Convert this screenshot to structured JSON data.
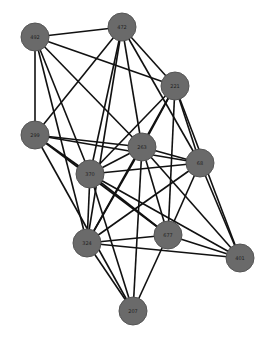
{
  "graph": {
    "colors": {
      "background": "#ffffff",
      "node_fill": "#6a6a6a",
      "edge": "#111111",
      "label": "#222222"
    },
    "nodes": [
      {
        "id": "492",
        "label": "492",
        "x": 35,
        "y": 37
      },
      {
        "id": "472",
        "label": "472",
        "x": 122,
        "y": 27
      },
      {
        "id": "221",
        "label": "221",
        "x": 175,
        "y": 86
      },
      {
        "id": "299",
        "label": "299",
        "x": 35,
        "y": 135
      },
      {
        "id": "263",
        "label": "263",
        "x": 142,
        "y": 147
      },
      {
        "id": "68",
        "label": "68",
        "x": 200,
        "y": 163
      },
      {
        "id": "370",
        "label": "370",
        "x": 90,
        "y": 174
      },
      {
        "id": "324",
        "label": "324",
        "x": 87,
        "y": 243
      },
      {
        "id": "677",
        "label": "677",
        "x": 168,
        "y": 235
      },
      {
        "id": "401",
        "label": "401",
        "x": 240,
        "y": 258
      },
      {
        "id": "207",
        "label": "207",
        "x": 133,
        "y": 311
      }
    ],
    "edges": [
      [
        "492",
        "472"
      ],
      [
        "492",
        "221"
      ],
      [
        "492",
        "299"
      ],
      [
        "492",
        "370"
      ],
      [
        "492",
        "263"
      ],
      [
        "492",
        "324"
      ],
      [
        "472",
        "221"
      ],
      [
        "472",
        "299"
      ],
      [
        "472",
        "263"
      ],
      [
        "472",
        "68"
      ],
      [
        "472",
        "370"
      ],
      [
        "472",
        "324"
      ],
      [
        "221",
        "263"
      ],
      [
        "221",
        "370"
      ],
      [
        "221",
        "68"
      ],
      [
        "221",
        "677"
      ],
      [
        "221",
        "401"
      ],
      [
        "221",
        "324"
      ],
      [
        "299",
        "263"
      ],
      [
        "299",
        "68"
      ],
      [
        "299",
        "370"
      ],
      [
        "299",
        "677"
      ],
      [
        "299",
        "207"
      ],
      [
        "263",
        "370"
      ],
      [
        "263",
        "68"
      ],
      [
        "263",
        "324"
      ],
      [
        "263",
        "677"
      ],
      [
        "263",
        "207"
      ],
      [
        "263",
        "401"
      ],
      [
        "68",
        "370"
      ],
      [
        "68",
        "324"
      ],
      [
        "68",
        "677"
      ],
      [
        "68",
        "401"
      ],
      [
        "370",
        "324"
      ],
      [
        "370",
        "677"
      ],
      [
        "370",
        "401"
      ],
      [
        "370",
        "207"
      ],
      [
        "324",
        "677"
      ],
      [
        "324",
        "401"
      ],
      [
        "324",
        "207"
      ],
      [
        "677",
        "401"
      ],
      [
        "677",
        "207"
      ]
    ]
  }
}
